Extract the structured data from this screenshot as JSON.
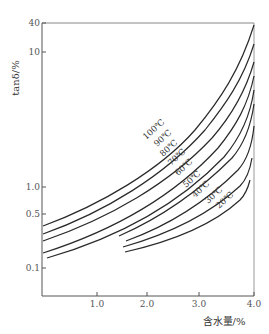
{
  "chart_data": {
    "type": "line",
    "title": "",
    "xlabel": "含水量/%",
    "ylabel": "tanδ/%",
    "xlim": [
      0,
      4.0
    ],
    "ylim": [
      0.05,
      40
    ],
    "y_scale": "log",
    "grid": false,
    "x_ticks": [
      "1.0",
      "2.0",
      "3.0",
      "4.0"
    ],
    "y_ticks": [
      "40",
      "10",
      "1.0",
      "0.5",
      "0.1"
    ],
    "legend_position": "inline-curve-labels",
    "series": [
      {
        "name": "100℃",
        "x": [
          0.0,
          1.0,
          2.0,
          3.0,
          4.0
        ],
        "y": [
          0.4,
          0.8,
          1.8,
          5.0,
          40
        ]
      },
      {
        "name": "90℃",
        "x": [
          0.0,
          1.0,
          2.0,
          3.0,
          4.0
        ],
        "y": [
          0.32,
          0.62,
          1.35,
          3.6,
          20
        ]
      },
      {
        "name": "80℃",
        "x": [
          0.0,
          1.0,
          2.0,
          3.0,
          4.0
        ],
        "y": [
          0.26,
          0.5,
          1.05,
          2.7,
          12
        ]
      },
      {
        "name": "70℃",
        "x": [
          0.0,
          1.0,
          2.0,
          3.0,
          4.0
        ],
        "y": [
          0.19,
          0.36,
          0.78,
          2.0,
          8
        ]
      },
      {
        "name": "60℃",
        "x": [
          0.1,
          1.0,
          2.0,
          3.0,
          4.0
        ],
        "y": [
          0.15,
          0.28,
          0.6,
          1.5,
          5.5
        ]
      },
      {
        "name": "50℃",
        "x": [
          1.5,
          2.0,
          3.0,
          4.0
        ],
        "y": [
          0.24,
          0.38,
          0.95,
          3.5
        ]
      },
      {
        "name": "40℃",
        "x": [
          1.6,
          2.0,
          3.0,
          4.0
        ],
        "y": [
          0.21,
          0.3,
          0.75,
          2.0
        ]
      },
      {
        "name": "30℃",
        "x": [
          1.55,
          2.0,
          3.0,
          4.0
        ],
        "y": [
          0.19,
          0.25,
          0.55,
          1.3
        ]
      },
      {
        "name": "20℃",
        "x": [
          1.6,
          2.0,
          3.0,
          4.0
        ],
        "y": [
          0.17,
          0.21,
          0.42,
          1.0
        ]
      }
    ],
    "annotations": [
      "100℃",
      "90℃",
      "80℃",
      "70℃",
      "60℃",
      "50℃",
      "40℃",
      "30℃",
      "20℃"
    ]
  },
  "axes": {
    "y_label": "tanδ/%",
    "x_label": "含水量/%",
    "y_ticks": [
      {
        "label": "40",
        "y": 23
      },
      {
        "label": "10",
        "y": 52
      },
      {
        "label": "1.0",
        "y": 187
      },
      {
        "label": "0.5",
        "y": 214
      },
      {
        "label": "0.1",
        "y": 268
      }
    ],
    "x_ticks": [
      {
        "label": "1.0",
        "x": 97
      },
      {
        "label": "2.0",
        "x": 147
      },
      {
        "label": "3.0",
        "x": 199
      },
      {
        "label": "4.0",
        "x": 254
      }
    ]
  },
  "curve_labels": [
    {
      "text": "100℃",
      "x": 146,
      "y": 140
    },
    {
      "text": "90℃",
      "x": 157,
      "y": 147
    },
    {
      "text": "80℃",
      "x": 163,
      "y": 157
    },
    {
      "text": "70℃",
      "x": 171,
      "y": 166
    },
    {
      "text": "60℃",
      "x": 178,
      "y": 176
    },
    {
      "text": "50℃",
      "x": 186,
      "y": 188
    },
    {
      "text": "40℃",
      "x": 195,
      "y": 198
    },
    {
      "text": "30℃",
      "x": 208,
      "y": 204
    },
    {
      "text": "20℃",
      "x": 219,
      "y": 209
    }
  ],
  "curves": [
    {
      "name": "100℃",
      "d": "M43,226 C100,205 160,170 195,130 C220,100 240,70 254,25"
    },
    {
      "name": "90℃",
      "d": "M43,234 C105,212 165,175 205,130 C225,105 243,80 254,44"
    },
    {
      "name": "80℃",
      "d": "M43,241 C110,218 170,183 212,138 C232,115 246,90 254,62"
    },
    {
      "name": "70℃",
      "d": "M43,253 C115,230 175,195 218,148 C236,126 248,105 254,76"
    },
    {
      "name": "60℃",
      "d": "M47,258 C120,237 180,203 224,157 C240,138 250,118 254,90"
    },
    {
      "name": "50℃",
      "d": "M119,236 C160,218 200,190 232,158 C245,143 251,125 254,104"
    },
    {
      "name": "40℃",
      "d": "M126,241 C170,225 208,200 238,170 C247,160 252,146 254,126"
    },
    {
      "name": "30℃",
      "d": "M123,247 C172,233 212,212 240,186 C247,179 250,170 252,158"
    },
    {
      "name": "20℃",
      "d": "M125,252 C178,240 216,222 240,200 C245,195 248,188 250,180"
    }
  ]
}
